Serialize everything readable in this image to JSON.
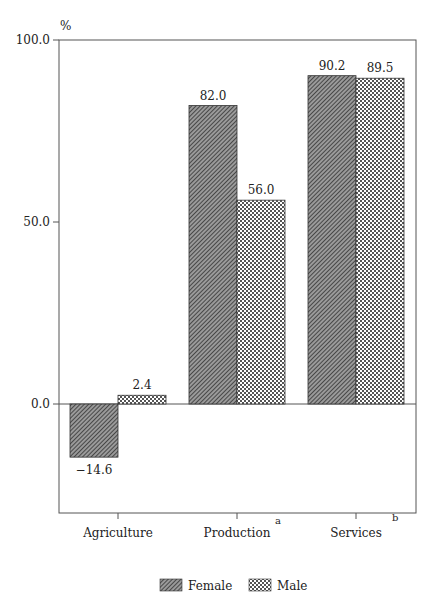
{
  "chart_data": {
    "type": "bar",
    "title": "",
    "xlabel": "",
    "ylabel": "%",
    "ylim": [
      -30,
      100
    ],
    "yticks": [
      0.0,
      50.0,
      100.0
    ],
    "ytick_labels": [
      "0.0",
      "50.0",
      "100.0"
    ],
    "categories": [
      "Agriculture",
      "Production",
      "Services"
    ],
    "category_superscripts": [
      "",
      "a",
      "b"
    ],
    "series": [
      {
        "name": "Female",
        "pattern": "diagonal-hatch",
        "values": [
          -14.6,
          82.0,
          90.2
        ],
        "labels": [
          "−14.6",
          "82.0",
          "90.2"
        ]
      },
      {
        "name": "Male",
        "pattern": "cross-hatch",
        "values": [
          2.4,
          56.0,
          89.5
        ],
        "labels": [
          "2.4",
          "56.0",
          "89.5"
        ]
      }
    ],
    "grid": false,
    "legend_position": "bottom"
  },
  "legend": {
    "items": [
      {
        "label": "Female"
      },
      {
        "label": "Male"
      }
    ]
  }
}
